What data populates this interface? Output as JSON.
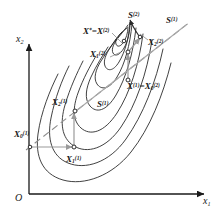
{
  "figure": {
    "kind": "optimization-contour-diagram",
    "colors": {
      "contour": "#2b2b2b",
      "axis": "#1a1a1a",
      "path_arrow": "#9a9a9a",
      "conjugate_line": "#6e6e6e",
      "text": "#1a1a1a",
      "background": "#ffffff"
    }
  },
  "axes": {
    "origin_label": "O",
    "x_axis_label": "x",
    "x_axis_sub": "1",
    "y_axis_label": "x",
    "y_axis_sub": "2"
  },
  "points": [
    {
      "id": "x0_1",
      "base": "X",
      "sub": "0",
      "sup": "(1)",
      "label": "X0(1)",
      "x": 22,
      "y": 136
    },
    {
      "id": "x1_1",
      "base": "X",
      "sub": "1",
      "sup": "(1)",
      "label": "X1(1)",
      "x": 78,
      "y": 152
    },
    {
      "id": "x2_1",
      "base": "X",
      "sub": "2",
      "sup": "(1)",
      "label": "X2(1)",
      "x": 66,
      "y": 98
    },
    {
      "id": "s1_mid",
      "base": "S",
      "sub": "",
      "sup": "(1)",
      "label": "S(1)",
      "x": 98,
      "y": 100
    },
    {
      "id": "x1_x0_2",
      "base": "X",
      "sub": "",
      "sup": "(1)",
      "label": "X(1)=X0(2)",
      "x": 126,
      "y": 84
    },
    {
      "id": "x1_2",
      "base": "X",
      "sub": "1",
      "sup": "(2)",
      "label": "X1(2)",
      "x": 95,
      "y": 52
    },
    {
      "id": "x2_2",
      "base": "X",
      "sub": "2",
      "sup": "(2)",
      "label": "X2(2)",
      "x": 150,
      "y": 38
    },
    {
      "id": "s2",
      "base": "S",
      "sub": "",
      "sup": "(2)",
      "label": "S(2)",
      "x": 131,
      "y": 12
    },
    {
      "id": "s1_top",
      "base": "S",
      "sub": "",
      "sup": "(1)",
      "label": "S(1)",
      "x": 167,
      "y": 17
    },
    {
      "id": "xstar",
      "base": "X",
      "sub": "",
      "sup": "(2)",
      "label": "X*=X(2)",
      "x": 87,
      "y": 28
    }
  ],
  "labels": {
    "x0_1": "X",
    "x1_1": "X",
    "x2_1": "X",
    "s1_mid": "S",
    "x_1_eq": "X",
    "x_1_eq_mid": "=X",
    "x1_2": "X",
    "x2_2": "X",
    "s2": "S",
    "s1_top": "S",
    "xstar_a": "X",
    "xstar_star": "*",
    "xstar_b": "=X",
    "sub_0": "0",
    "sub_1": "1",
    "sub_2": "2",
    "sup_1": "(1)",
    "sup_2": "(2)"
  }
}
